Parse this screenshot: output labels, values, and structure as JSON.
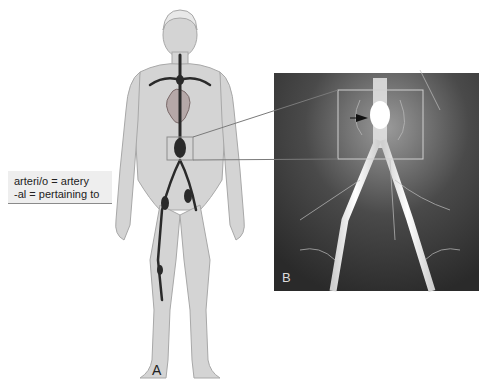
{
  "glossary": {
    "lines": [
      "arteri/o = artery",
      "-al = pertaining to"
    ]
  },
  "panels": {
    "a_label": "A",
    "b_label": "B"
  },
  "figure": {
    "colors": {
      "skin": "#d4d4d4",
      "skin_outline": "#a8a8a8",
      "artery": "#2a2a2a",
      "heart": "#b5a8a8",
      "xray_bg": "#3a3a3a",
      "callout_box": "#8c8c8c"
    }
  }
}
